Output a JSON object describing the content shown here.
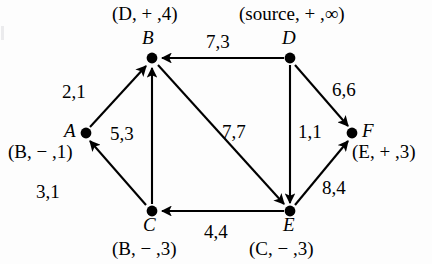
{
  "figure": {
    "ink_color": "#000000",
    "background": "#fdfdfd"
  },
  "nodes": [
    {
      "id": "B",
      "letter": "B",
      "x": 152,
      "y": 58,
      "label": "(D, + ,4)",
      "label_x": 112,
      "label_y": 4,
      "letter_x": 142,
      "letter_y": 28
    },
    {
      "id": "D",
      "letter": "D",
      "x": 290,
      "y": 58,
      "label": "(source, + ,∞)",
      "label_x": 239,
      "label_y": 4,
      "letter_x": 282,
      "letter_y": 28
    },
    {
      "id": "A",
      "letter": "A",
      "x": 86,
      "y": 133,
      "label": "(B, − ,1)",
      "label_x": 8,
      "label_y": 142,
      "letter_x": 64,
      "letter_y": 121
    },
    {
      "id": "F",
      "letter": "F",
      "x": 352,
      "y": 133,
      "label": "(E, + ,3)",
      "label_x": 352,
      "label_y": 142,
      "letter_x": 362,
      "letter_y": 121
    },
    {
      "id": "C",
      "letter": "C",
      "x": 152,
      "y": 211,
      "label": "(B, − ,3)",
      "label_x": 112,
      "label_y": 239,
      "letter_x": 143,
      "letter_y": 215
    },
    {
      "id": "E",
      "letter": "E",
      "x": 290,
      "y": 211,
      "label": "(C, − ,3)",
      "label_x": 249,
      "label_y": 239,
      "letter_x": 283,
      "letter_y": 215
    }
  ],
  "edges": [
    {
      "id": "A-B",
      "from": "A",
      "to": "B",
      "capacity": 2,
      "flow": 1,
      "label": "2,1",
      "label_x": 62,
      "label_y": 82
    },
    {
      "id": "C-B",
      "from": "C",
      "to": "B",
      "capacity": 5,
      "flow": 3,
      "label": "5,3",
      "label_x": 110,
      "label_y": 124
    },
    {
      "id": "C-A",
      "from": "C",
      "to": "A",
      "capacity": 3,
      "flow": 1,
      "label": "3,1",
      "label_x": 36,
      "label_y": 182
    },
    {
      "id": "D-B",
      "from": "D",
      "to": "B",
      "capacity": 7,
      "flow": 3,
      "label": "7,3",
      "label_x": 206,
      "label_y": 32
    },
    {
      "id": "B-E",
      "from": "B",
      "to": "E",
      "capacity": 7,
      "flow": 7,
      "label": "7,7",
      "label_x": 222,
      "label_y": 122
    },
    {
      "id": "D-E",
      "from": "D",
      "to": "E",
      "capacity": 1,
      "flow": 1,
      "label": "1,1",
      "label_x": 298,
      "label_y": 122
    },
    {
      "id": "D-F",
      "from": "D",
      "to": "F",
      "capacity": 6,
      "flow": 6,
      "label": "6,6",
      "label_x": 332,
      "label_y": 80
    },
    {
      "id": "E-F",
      "from": "E",
      "to": "F",
      "capacity": 8,
      "flow": 4,
      "label": "8,4",
      "label_x": 322,
      "label_y": 178
    },
    {
      "id": "E-C",
      "from": "E",
      "to": "C",
      "capacity": 4,
      "flow": 4,
      "label": "4,4",
      "label_x": 204,
      "label_y": 222
    }
  ]
}
